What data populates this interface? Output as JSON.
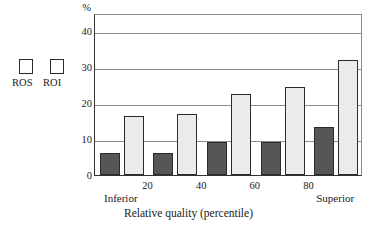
{
  "chart_data": {
    "type": "bar",
    "title": "",
    "subtitle": "",
    "xlabel": "Relative quality (percentile)",
    "ylabel": "%",
    "y_unit_label": "%",
    "categories": [
      "Inferior",
      "20",
      "40",
      "60",
      "80"
    ],
    "x_tick_labels": [
      "20",
      "40",
      "60",
      "80"
    ],
    "x_end_labels": {
      "left": "Inferior",
      "right": "Superior"
    },
    "series": [
      {
        "name": "ROS",
        "color": "#565656",
        "values": [
          6.1,
          6.2,
          9.3,
          9.2,
          13.4
        ]
      },
      {
        "name": "ROI",
        "color": "#ebebeb",
        "values": [
          16.3,
          16.9,
          22.4,
          24.5,
          32.0
        ]
      }
    ],
    "ylim": [
      0,
      45
    ],
    "y_ticks": [
      0,
      10,
      20,
      30,
      40
    ],
    "y_tick_labels": [
      "0",
      "10",
      "20",
      "30",
      "40"
    ],
    "grid": true,
    "grid_axis": "y",
    "legend": {
      "position": "outside-left",
      "entries": [
        "ROS",
        "ROI"
      ]
    }
  },
  "legend": {
    "ros_label": "ROS",
    "roi_label": "ROI"
  },
  "axes": {
    "y_unit": "%",
    "x_title": "Relative quality (percentile)",
    "left_anchor": "Inferior",
    "right_anchor": "Superior"
  },
  "colors": {
    "ros_fill": "#565656",
    "roi_fill": "#ebebeb",
    "outline": "#2b2b2b",
    "gridline": "#8c8c8c",
    "axis": "#333333",
    "background": "#ffffff"
  }
}
